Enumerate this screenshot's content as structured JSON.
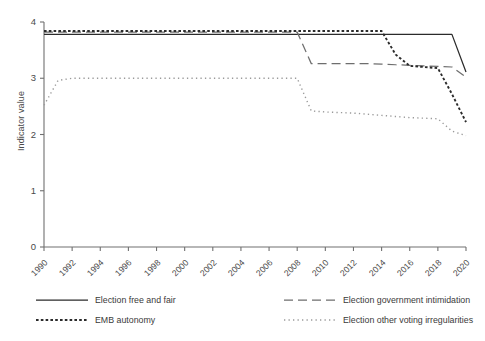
{
  "chart_data": {
    "type": "line",
    "title": "",
    "xlabel": "",
    "ylabel": "Indicator value",
    "xlim": [
      1990,
      2020
    ],
    "ylim": [
      0,
      4
    ],
    "yticks": [
      0,
      1,
      2,
      3,
      4
    ],
    "ytick_labels": [
      "0",
      "1",
      "2",
      "3",
      "4"
    ],
    "xticks": [
      1990,
      1992,
      1994,
      1996,
      1998,
      2000,
      2002,
      2004,
      2006,
      2008,
      2010,
      2012,
      2014,
      2016,
      2018,
      2020
    ],
    "xtick_labels": [
      "1990",
      "1992",
      "1994",
      "1996",
      "1998",
      "2000",
      "2002",
      "2004",
      "2006",
      "2008",
      "2010",
      "2012",
      "2014",
      "2016",
      "2018",
      "2020"
    ],
    "grid": false,
    "legend_position": "below",
    "x": [
      1990,
      1991,
      1992,
      1993,
      1994,
      1995,
      1996,
      1997,
      1998,
      1999,
      2000,
      2001,
      2002,
      2003,
      2004,
      2005,
      2006,
      2007,
      2008,
      2009,
      2010,
      2011,
      2012,
      2013,
      2014,
      2015,
      2016,
      2017,
      2018,
      2019,
      2020
    ],
    "series": [
      {
        "name": "Election free and fair",
        "style": "solid",
        "color": "#2b2b2b",
        "values": [
          3.78,
          3.78,
          3.78,
          3.78,
          3.78,
          3.78,
          3.78,
          3.78,
          3.78,
          3.78,
          3.78,
          3.78,
          3.78,
          3.78,
          3.78,
          3.78,
          3.78,
          3.78,
          3.78,
          3.78,
          3.78,
          3.78,
          3.78,
          3.78,
          3.78,
          3.78,
          3.78,
          3.78,
          3.78,
          3.78,
          3.11
        ]
      },
      {
        "name": "Election government intimidation",
        "style": "dashed",
        "color": "#6e6e6e",
        "values": [
          3.82,
          3.82,
          3.82,
          3.82,
          3.82,
          3.82,
          3.82,
          3.82,
          3.82,
          3.82,
          3.82,
          3.82,
          3.82,
          3.82,
          3.82,
          3.82,
          3.82,
          3.82,
          3.82,
          3.26,
          3.26,
          3.26,
          3.26,
          3.26,
          3.25,
          3.24,
          3.23,
          3.22,
          3.21,
          3.2,
          3.02
        ]
      },
      {
        "name": "EMB autonomy",
        "style": "dotted-coarse",
        "color": "#2b2b2b",
        "values": [
          3.84,
          3.84,
          3.84,
          3.84,
          3.84,
          3.84,
          3.84,
          3.84,
          3.84,
          3.84,
          3.84,
          3.84,
          3.84,
          3.84,
          3.84,
          3.84,
          3.84,
          3.84,
          3.84,
          3.84,
          3.84,
          3.84,
          3.84,
          3.84,
          3.84,
          3.42,
          3.22,
          3.2,
          3.18,
          2.72,
          2.22
        ]
      },
      {
        "name": "Election other voting irregularities",
        "style": "dotted-fine",
        "color": "#9a9a9a",
        "values": [
          2.52,
          2.96,
          3.0,
          3.0,
          3.0,
          3.0,
          3.0,
          3.0,
          3.0,
          3.0,
          3.0,
          3.0,
          3.0,
          3.0,
          3.0,
          3.0,
          3.0,
          3.0,
          3.0,
          2.42,
          2.4,
          2.39,
          2.38,
          2.36,
          2.34,
          2.32,
          2.3,
          2.29,
          2.28,
          2.06,
          1.98
        ]
      }
    ]
  },
  "legend": {
    "items": [
      {
        "label": "Election free and fair",
        "style": "solid"
      },
      {
        "label": "Election government intimidation",
        "style": "dashed"
      },
      {
        "label": "EMB autonomy",
        "style": "dotted-coarse"
      },
      {
        "label": "Election other voting irregularities",
        "style": "dotted-fine"
      }
    ]
  }
}
